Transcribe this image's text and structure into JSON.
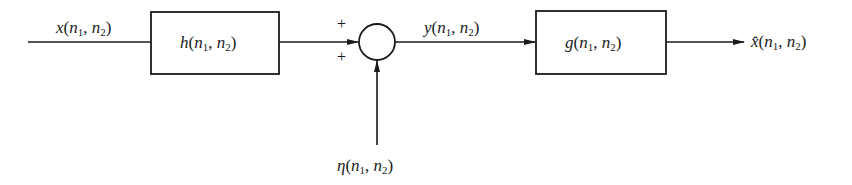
{
  "diagram": {
    "type": "block-diagram",
    "input_signal": {
      "func": "x",
      "args": [
        "n1",
        "n2"
      ],
      "label": "x(n1, n2)"
    },
    "blocks": [
      {
        "id": "h",
        "func": "h",
        "label": "h(n1, n2)"
      },
      {
        "id": "g",
        "func": "g",
        "label": "g(n1, n2)"
      }
    ],
    "summing_junction": {
      "signs": [
        "+",
        "+"
      ]
    },
    "noise_signal": {
      "func": "η",
      "label": "η(n1, n2)"
    },
    "intermediate_signal": {
      "func": "y",
      "label": "y(n1, n2)"
    },
    "output_signal": {
      "func": "x̂",
      "label": "x̂(n1, n2)"
    },
    "colors": {
      "stroke": "#1a1a1a",
      "background": "#ffffff"
    }
  },
  "labels": {
    "x_func": "x",
    "h_func": "h",
    "y_func": "y",
    "g_func": "g",
    "eta_func": "η",
    "xhat_func": "x̂",
    "open": "(",
    "n": "n",
    "sub1": "1",
    "comma": ", ",
    "sub2": "2",
    "close": ")",
    "plus_top": "+",
    "plus_bottom": "+"
  }
}
